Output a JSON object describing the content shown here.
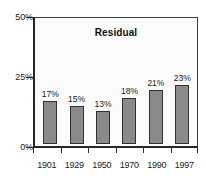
{
  "chart_data": {
    "type": "bar",
    "title": "Residual",
    "xlabel": "",
    "ylabel": "",
    "categories": [
      "1901",
      "1929",
      "1950",
      "1970",
      "1990",
      "1997"
    ],
    "values": [
      17,
      15,
      13,
      18,
      21,
      23
    ],
    "value_labels": [
      "17%",
      "15%",
      "13%",
      "18%",
      "21%",
      "23%"
    ],
    "ylim": [
      0,
      50
    ],
    "ytick_values": [
      0,
      25,
      50
    ],
    "ytick_labels": [
      "0%",
      "25%",
      "50%"
    ],
    "grid": false,
    "legend": false,
    "colors": {
      "bar_fill": "#8a8a8a",
      "bar_outline": "#303030",
      "axis": "#262626",
      "text": "#1a1a1a",
      "plot_background": "#fbfbfb",
      "figure_background": "#ffffff"
    }
  }
}
